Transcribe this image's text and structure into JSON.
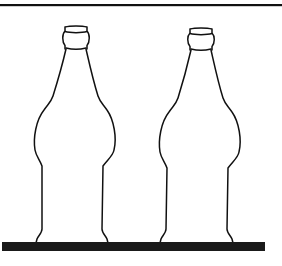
{
  "illustration": {
    "subject": "two glass bottles standing on a shelf",
    "colors": {
      "background": "#ffffff",
      "line": "#111111",
      "shelf": "#1a1a1a"
    },
    "top_rule": {
      "x1": 0,
      "x2": 282,
      "y": 5,
      "thickness": 2
    },
    "shelf": {
      "x": 2,
      "y": 242,
      "width": 263,
      "height": 9
    },
    "bottles": [
      {
        "id": "bottle-left",
        "label": "bottle"
      },
      {
        "id": "bottle-right",
        "label": "bottle"
      }
    ]
  }
}
